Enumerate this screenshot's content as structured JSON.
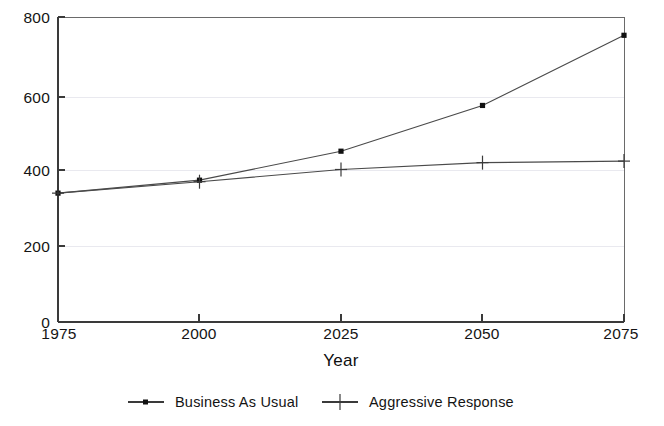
{
  "chart_data": {
    "type": "line",
    "title": "",
    "subtitle": "",
    "xlabel": "Year",
    "ylabel": "",
    "x": [
      1975,
      2000,
      2025,
      2050,
      2075
    ],
    "categories": [
      "1975",
      "2000",
      "2025",
      "2050",
      "2075"
    ],
    "xlim": [
      1975,
      2075
    ],
    "ylim": [
      0,
      800
    ],
    "y_ticks": [
      0,
      200,
      400,
      600,
      800
    ],
    "y_tick_labels": [
      "0",
      "200",
      "400",
      "600",
      "800"
    ],
    "x_ticks": [
      1975,
      2000,
      2025,
      2050,
      2075
    ],
    "x_tick_labels": [
      "1975",
      "2000",
      "2025",
      "2050",
      "2075"
    ],
    "grid": "horizontal-only-faint",
    "legend_position": "below-axis-center",
    "series": [
      {
        "name": "Business As Usual",
        "marker": "square-dot",
        "color": "#4a4a4a",
        "values": [
          338,
          372,
          448,
          568,
          752
        ]
      },
      {
        "name": "Aggressive Response",
        "marker": "plus",
        "color": "#3a3a3a",
        "values": [
          338,
          368,
          400,
          418,
          422
        ]
      }
    ]
  },
  "axis": {
    "x_title": "Year",
    "y_tick_800": "800",
    "y_tick_600": "600",
    "y_tick_400": "400",
    "y_tick_200": "200",
    "y_tick_0": "0",
    "x_tick_1975": "1975",
    "x_tick_2000": "2000",
    "x_tick_2025": "2025",
    "x_tick_2050": "2050",
    "x_tick_2075": "2075"
  },
  "legend": {
    "entries": [
      {
        "label": "Business As Usual",
        "marker": "square-dot"
      },
      {
        "label": "Aggressive Response",
        "marker": "plus"
      }
    ]
  },
  "colors": {
    "background": "#ffffff",
    "ink": "#141414",
    "line": "#4a4a4a",
    "grid": "#e9e9ef",
    "frame": "#6a6a6a"
  }
}
